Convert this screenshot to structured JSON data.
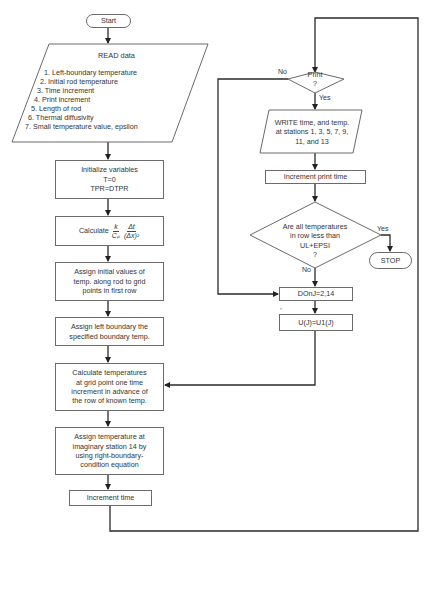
{
  "flowchart": {
    "start": "Start",
    "read": {
      "title": "READ data",
      "items": [
        "1.  Left-boundary temperature",
        "2.  Initial rod temperature",
        "3.  Time increment",
        "4.  Print increment",
        "5.  Length of rod",
        "6.  Thermal diffusivity",
        "7.  Small temperature value, epsilon"
      ]
    },
    "initialize": {
      "lines": [
        "Initialize variables",
        "T=0",
        "TPR=DTPR"
      ]
    },
    "calculate": {
      "prefix": "Calculate",
      "frac1_num": "k",
      "frac1_den": "Cₚ",
      "frac2_num": "Δt",
      "frac2_den": "(Δx)²"
    },
    "assign_initial": {
      "lines": [
        "Assign initial values of",
        "temp. along rod to grid",
        "points in first row"
      ]
    },
    "assign_left": {
      "lines": [
        "Assign left boundary the",
        "specified boundary temp."
      ]
    },
    "calc_temps": {
      "lines": [
        "Calculate temperatures",
        "at grid point one time",
        "increment in advance of",
        "the row of known temp."
      ]
    },
    "assign_station": {
      "lines": [
        "Assign temperature at",
        "imaginary station 14 by",
        "using right-boundary-",
        "condition equation"
      ]
    },
    "increment_time": "Increment time",
    "print_decision": {
      "lines": [
        "Print",
        "?"
      ],
      "no_label": "No",
      "yes_label": "Yes"
    },
    "write": {
      "lines": [
        "WRITE time, and temp.",
        "at stations 1, 3, 5, 7, 9,",
        "11, and 13"
      ]
    },
    "increment_print": "Increment print time",
    "all_temps_decision": {
      "lines": [
        "Are all temperatures",
        "in row less than",
        "UL+EPSI",
        "?"
      ],
      "yes_label": "Yes",
      "no_label": "No"
    },
    "stop": "STOP",
    "do_loop": "DOnJ=2,14",
    "assign_u": "U(J)=U1(J)",
    "stray_mark": "n"
  },
  "colors": {
    "line": "#2a2a2a",
    "box_border": "#6a6a6a",
    "text": "#333333",
    "background": "#ffffff"
  }
}
